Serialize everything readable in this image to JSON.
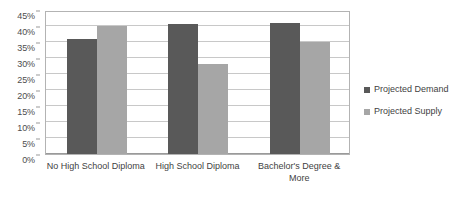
{
  "chart_data": {
    "type": "bar",
    "title": "",
    "subtitle": "",
    "xlabel": "",
    "ylabel": "",
    "categories": [
      "No High School Diploma",
      "High School Diploma",
      "Bachelor's Degree & More"
    ],
    "series": [
      {
        "name": "Projected Demand",
        "color": "#595959",
        "values": [
          36,
          40.5,
          41
        ]
      },
      {
        "name": "Projected Supply",
        "color": "#a6a6a6",
        "values": [
          40,
          28,
          35
        ]
      }
    ],
    "ylim": [
      0,
      45
    ],
    "ytick_values": [
      0,
      5,
      10,
      15,
      20,
      25,
      30,
      35,
      40,
      45
    ],
    "ytick_labels": [
      "0%",
      "5%",
      "10%",
      "15%",
      "20%",
      "25%",
      "30%",
      "35%",
      "40%",
      "45%"
    ],
    "grid": true,
    "grid_axis": "y",
    "legend_position": "right",
    "annotations": []
  },
  "axis": {
    "y_labels": [
      "45%",
      "40%",
      "35%",
      "30%",
      "25%",
      "20%",
      "15%",
      "10%",
      "5%",
      "0%"
    ],
    "x_labels": [
      "No High School Diploma",
      "High School Diploma",
      "Bachelor's Degree & More"
    ]
  },
  "legend": {
    "items": [
      {
        "label": "Projected Demand",
        "color": "#595959"
      },
      {
        "label": "Projected Supply",
        "color": "#a6a6a6"
      }
    ]
  },
  "colors": {
    "demand": "#595959",
    "supply": "#a6a6a6",
    "gridline": "#c8c8c8",
    "plot_border": "#b3b3b3",
    "text": "#3f3f3f",
    "background": "#ffffff"
  }
}
